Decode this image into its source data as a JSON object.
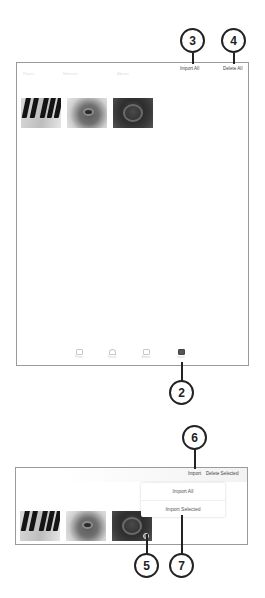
{
  "top_screen": {
    "toolbar": {
      "faint_tabs": [
        "Photos",
        "Moments",
        "Albums"
      ],
      "import_all_label": "Import All",
      "delete_all_label": "Delete All"
    },
    "thumbnails": [
      {
        "subject": "piano-keys"
      },
      {
        "subject": "guitar-soundhole"
      },
      {
        "subject": "guitar-closeup-dark"
      }
    ],
    "tabbar": {
      "items": [
        {
          "label": "Photos",
          "icon": "photos-icon",
          "active": false
        },
        {
          "label": "Shared",
          "icon": "cloud-icon",
          "active": false
        },
        {
          "label": "Albums",
          "icon": "albums-icon",
          "active": false
        },
        {
          "label": "Import",
          "icon": "import-camera-icon",
          "active": true
        }
      ]
    }
  },
  "bottom_screen": {
    "toolbar": {
      "import_label": "Import",
      "delete_selected_label": "Delete Selected"
    },
    "popup_menu": {
      "items": [
        "Import All",
        "Import Selected"
      ]
    },
    "thumbnails": [
      {
        "subject": "piano-keys",
        "selected": false
      },
      {
        "subject": "guitar-soundhole",
        "selected": false
      },
      {
        "subject": "guitar-closeup-dark",
        "selected": true
      }
    ],
    "selected_check": "✓"
  },
  "callouts": [
    "2",
    "3",
    "4",
    "5",
    "6",
    "7"
  ]
}
